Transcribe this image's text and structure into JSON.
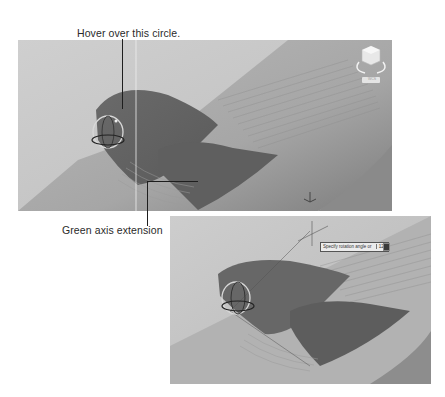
{
  "callouts": {
    "top": {
      "label": "Hover over this circle."
    },
    "bottom": {
      "label": "Green axis extension"
    }
  },
  "screenshot_1": {
    "viewcube": {
      "icon": "viewcube-icon",
      "label": "WCS"
    },
    "gizmo": {
      "icon": "rotate-gizmo-icon"
    },
    "ucs": {
      "icon": "ucs-axis-icon"
    }
  },
  "screenshot_2": {
    "tooltip": {
      "prompt": "Specify rotation angle or",
      "value": "120"
    },
    "gizmo": {
      "icon": "rotate-gizmo-icon"
    }
  },
  "colors": {
    "background": "#ffffff",
    "viewport": "#c4c4c4",
    "surface_light": "#b9b9b9",
    "surface_dark": "#6e6e6e",
    "leader": "#1e1e1e"
  }
}
